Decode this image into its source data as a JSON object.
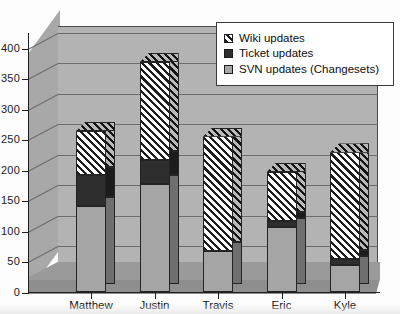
{
  "chart_data": {
    "type": "bar",
    "subtype": "stacked-column-3d",
    "title": "",
    "xlabel": "",
    "ylabel": "",
    "ylim": [
      0,
      400
    ],
    "yticks": [
      0,
      50,
      100,
      150,
      200,
      250,
      300,
      350,
      400
    ],
    "ytick_labels": [
      "0",
      "50",
      "100",
      "150",
      "200",
      "250",
      "300",
      "350",
      "400"
    ],
    "grid": true,
    "legend_position": "top-right",
    "categories": [
      "Matthew",
      "Justin",
      "Travis",
      "Eric",
      "Kyle"
    ],
    "series": [
      {
        "name": "SVN updates (Changesets)",
        "pattern": "dotted",
        "color": "#a5a5a5",
        "values": [
          142,
          178,
          68,
          108,
          45
        ]
      },
      {
        "name": "Ticket updates",
        "pattern": "solid-dark",
        "color": "#2e2e2e",
        "values": [
          50,
          39,
          0,
          10,
          10
        ]
      },
      {
        "name": "Wiki updates",
        "pattern": "diagonal-hatch",
        "color": "#ffffff",
        "values": [
          73,
          161,
          188,
          80,
          175
        ]
      }
    ],
    "totals": [
      265,
      378,
      256,
      198,
      230
    ]
  },
  "legend": {
    "entries": [
      {
        "label": "Wiki updates",
        "swatch": "diagonal-hatch-swatch"
      },
      {
        "label": "Ticket updates",
        "swatch": "solid-dark-swatch"
      },
      {
        "label": "SVN updates (Changesets)",
        "swatch": "dotted-swatch"
      }
    ]
  },
  "axes": {
    "y_labels": [
      "400",
      "350",
      "300",
      "250",
      "200",
      "150",
      "100",
      "50",
      "0"
    ],
    "x_labels": [
      "Matthew",
      "Justin",
      "Travis",
      "Eric",
      "Kyle"
    ]
  },
  "colors": {
    "plot_background": "#b3b3b3",
    "side_wall": "#a8a8a8",
    "floor": "#8e8e8e",
    "gridline": "#6d6d6d",
    "axis": "#1f1f1f",
    "legend_background": "#ffffff",
    "svn_fill": "#a5a5a5",
    "ticket_fill": "#2e2e2e",
    "wiki_fill": "#ffffff"
  }
}
